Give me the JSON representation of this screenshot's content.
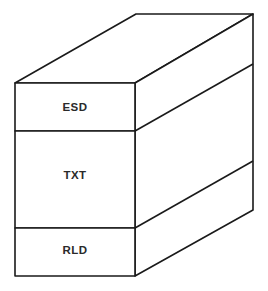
{
  "diagram": {
    "type": "3d-stacked-box",
    "sections": [
      {
        "label": "ESD"
      },
      {
        "label": "TXT"
      },
      {
        "label": "RLD"
      }
    ],
    "colors": {
      "stroke": "#1a1a1a",
      "fill": "#ffffff",
      "text": "#2a2a2a"
    }
  }
}
